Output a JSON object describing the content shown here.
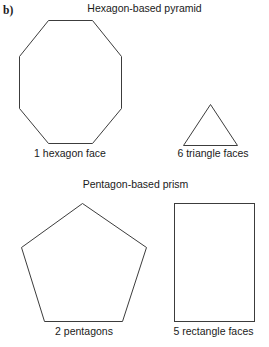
{
  "part": {
    "label": "b)"
  },
  "sections": [
    {
      "title": "Hexagon-based pyramid",
      "shapes": [
        {
          "name": "octagon",
          "caption": "1 hexagon face"
        },
        {
          "name": "triangle",
          "caption": "6 triangle faces"
        }
      ]
    },
    {
      "title": "Pentagon-based prism",
      "shapes": [
        {
          "name": "pentagon",
          "caption": "2 pentagons"
        },
        {
          "name": "rectangle",
          "caption": "5 rectangle faces"
        }
      ]
    }
  ],
  "colors": {
    "background": "#ffffff",
    "ink": "#1a1a1a",
    "stroke": "#3c3c3c"
  }
}
